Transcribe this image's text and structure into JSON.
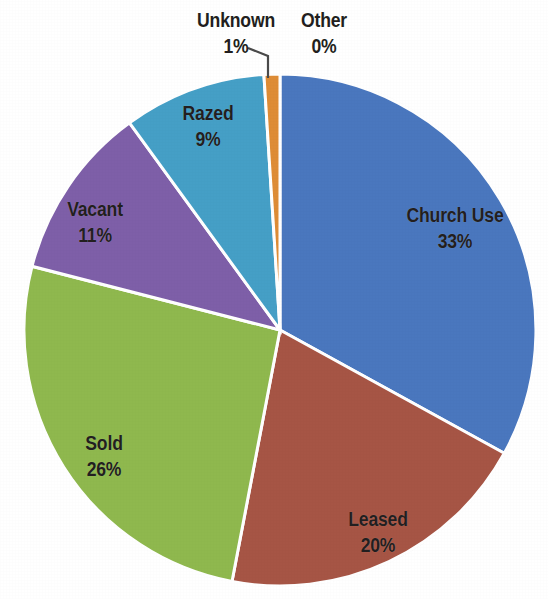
{
  "chart_data": {
    "type": "pie",
    "title": "",
    "subtitle": "",
    "xlabel": "",
    "ylabel": "",
    "legend_position": "none",
    "grid": false,
    "label_format": "name + percent",
    "start_angle_deg": 0,
    "direction": "clockwise",
    "categories": [
      "Church Use",
      "Leased",
      "Sold",
      "Vacant",
      "Razed",
      "Other",
      "Unknown"
    ],
    "values": [
      33,
      20,
      26,
      11,
      9,
      0,
      1
    ],
    "units": "percent",
    "slices": [
      {
        "name": "Church Use",
        "value": 33,
        "value_label": "33%",
        "color": "#4a77be",
        "label_placement": "inside",
        "start_deg": 0,
        "end_deg": 118.8
      },
      {
        "name": "Leased",
        "value": 20,
        "value_label": "20%",
        "color": "#a65545",
        "label_placement": "inside",
        "start_deg": 118.8,
        "end_deg": 190.8
      },
      {
        "name": "Sold",
        "value": 26,
        "value_label": "26%",
        "color": "#8fb84e",
        "label_placement": "inside",
        "start_deg": 190.8,
        "end_deg": 284.4
      },
      {
        "name": "Vacant",
        "value": 11,
        "value_label": "11%",
        "color": "#7e5fa8",
        "label_placement": "inside",
        "start_deg": 284.4,
        "end_deg": 324.0
      },
      {
        "name": "Razed",
        "value": 9,
        "value_label": "9%",
        "color": "#459fc6",
        "label_placement": "inside",
        "start_deg": 324.0,
        "end_deg": 356.4
      },
      {
        "name": "Other",
        "value": 0,
        "value_label": "0%",
        "color": "#4a77be",
        "label_placement": "outside",
        "start_deg": 356.4,
        "end_deg": 356.4
      },
      {
        "name": "Unknown",
        "value": 1,
        "value_label": "1%",
        "color": "#de8c36",
        "label_placement": "outside-with-leader",
        "start_deg": 356.4,
        "end_deg": 360.0
      }
    ],
    "geometry": {
      "center_x": 280,
      "center_y": 330,
      "radius": 256,
      "separator_color": "#ffffff",
      "separator_width": 3
    }
  },
  "labels": {
    "church_use": {
      "name": "Church Use",
      "value": "33%"
    },
    "leased": {
      "name": "Leased",
      "value": "20%"
    },
    "sold": {
      "name": "Sold",
      "value": "26%"
    },
    "vacant": {
      "name": "Vacant",
      "value": "11%"
    },
    "razed": {
      "name": "Razed",
      "value": "9%"
    },
    "unknown": {
      "name": "Unknown",
      "value": "1%"
    },
    "other": {
      "name": "Other",
      "value": "0%"
    }
  }
}
